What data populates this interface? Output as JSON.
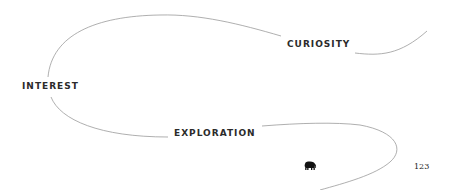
{
  "diagram": {
    "labels": {
      "curiosity": "CURIOSITY",
      "interest": "INTEREST",
      "exploration": "EXPLORATION"
    },
    "line_color": "#9a9a9a",
    "text_color": "#2b2b2b"
  },
  "footer": {
    "icon": "elephant-icon",
    "page_number": "123"
  }
}
